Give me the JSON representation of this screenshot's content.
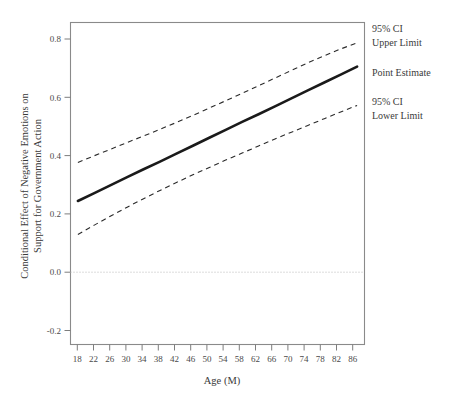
{
  "chart_data": {
    "type": "line",
    "title": "",
    "xlabel": "Age (M)",
    "ylabel": "Conditional Effect of Negative Emotions on Support for Government Action",
    "ylabel_line1": "Conditional Effect of Negative Emotions on",
    "ylabel_line2": "Support for Government Action",
    "x": [
      18,
      22,
      26,
      30,
      34,
      38,
      42,
      46,
      50,
      54,
      58,
      62,
      66,
      70,
      74,
      78,
      82,
      86
    ],
    "xticklabels": [
      "18",
      "22",
      "26",
      "30",
      "34",
      "38",
      "42",
      "46",
      "50",
      "54",
      "58",
      "62",
      "66",
      "70",
      "74",
      "78",
      "82",
      "86"
    ],
    "yticklabels": [
      "0.8",
      "0.6",
      "0.4",
      "0.2",
      "0.0",
      "-0.2"
    ],
    "yticks": [
      0.8,
      0.6,
      0.4,
      0.2,
      0.0,
      -0.2
    ],
    "xlim": [
      16.2,
      87.8
    ],
    "ylim": [
      -0.25,
      0.845
    ],
    "grid": false,
    "legend_position": "right-outside",
    "series": [
      {
        "name": "95% CI Upper Limit",
        "style": "dashed",
        "values": [
          0.369,
          0.392,
          0.414,
          0.437,
          0.459,
          0.482,
          0.505,
          0.529,
          0.554,
          0.579,
          0.604,
          0.63,
          0.656,
          0.682,
          0.708,
          0.732,
          0.755,
          0.776
        ]
      },
      {
        "name": "Point Estimate",
        "style": "solid",
        "values": [
          0.238,
          0.265,
          0.292,
          0.319,
          0.346,
          0.372,
          0.399,
          0.426,
          0.453,
          0.48,
          0.507,
          0.533,
          0.56,
          0.587,
          0.614,
          0.641,
          0.668,
          0.695
        ]
      },
      {
        "name": "95% CI Lower Limit",
        "style": "dashed",
        "values": [
          0.124,
          0.156,
          0.187,
          0.217,
          0.246,
          0.274,
          0.301,
          0.327,
          0.352,
          0.377,
          0.401,
          0.425,
          0.449,
          0.472,
          0.495,
          0.518,
          0.541,
          0.563
        ]
      }
    ],
    "reference_lines": [
      {
        "name": "zero-line",
        "axis": "y",
        "value": 0.0,
        "style": "dotted"
      }
    ],
    "annotations": [
      {
        "name": "ci-upper-annotation",
        "line1": "95% CI",
        "line2": "Upper Limit"
      },
      {
        "name": "point-estimate-annotation",
        "line1": "Point Estimate",
        "line2": ""
      },
      {
        "name": "ci-lower-annotation",
        "line1": "95% CI",
        "line2": "Lower Limit"
      }
    ],
    "colors": {
      "point_estimate": "#1a1a1a",
      "ci": "#2a2a2a",
      "frame": "#8a8a8a",
      "zero_line": "#b9b9b9",
      "background": "#ffffff"
    }
  }
}
